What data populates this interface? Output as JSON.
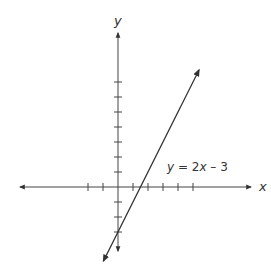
{
  "chart_data": {
    "type": "line",
    "title": "",
    "xlabel": "x",
    "ylabel": "y",
    "series": [
      {
        "name": "y = 2x - 3",
        "slope": 2,
        "intercept": -3,
        "x": [
          -0.97,
          5.4
        ],
        "y": [
          -4.93,
          7.8
        ]
      }
    ],
    "annotations": [
      {
        "text_parts": [
          "y",
          " = 2",
          "x",
          " – 3"
        ],
        "at": [
          3.3,
          1.4
        ]
      }
    ],
    "x_ticks": [
      -2,
      -1,
      1,
      2,
      3,
      4,
      5
    ],
    "y_ticks": [
      -3,
      -2,
      -1,
      1,
      2,
      3,
      4,
      5,
      6,
      7
    ],
    "xlim": [
      -6.7,
      9.0
    ],
    "ylim": [
      -4.8,
      8.1
    ],
    "grid": false,
    "legend": "none",
    "colors": {
      "axis": "#444444",
      "line": "#333333"
    }
  },
  "labels": {
    "x_axis": "x",
    "y_axis": "y",
    "equation_y": "y",
    "equation_mid": " = 2",
    "equation_x": "x",
    "equation_end": " – 3"
  }
}
